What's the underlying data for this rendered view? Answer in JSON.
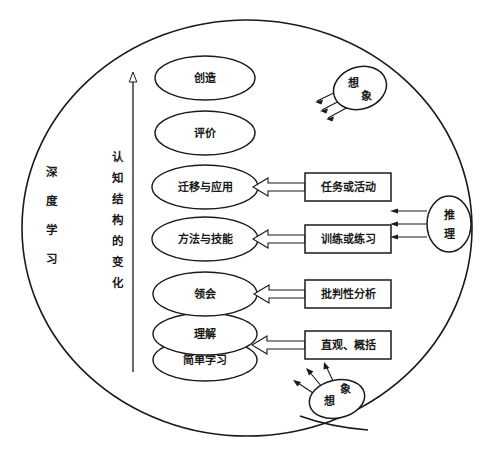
{
  "diagram": {
    "title_text_outer": "深度学习",
    "axis_label": "认知结构的变化",
    "outer_container": {
      "name": "deep-learning-boundary",
      "label_chars": [
        "深",
        "度",
        "学",
        "习"
      ]
    },
    "axis": {
      "name": "cognitive-structure-change-axis",
      "label_chars": [
        "认",
        "知",
        "结",
        "构",
        "的",
        "变",
        "化"
      ],
      "direction": "upward"
    },
    "stages": [
      {
        "id": "create",
        "label": "创造"
      },
      {
        "id": "evaluate",
        "label": "评价"
      },
      {
        "id": "transfer",
        "label": "迁移与应用"
      },
      {
        "id": "methods",
        "label": "方法与技能"
      },
      {
        "id": "comprehend",
        "label": "领会"
      },
      {
        "id": "understand",
        "label": "理解"
      },
      {
        "id": "simple",
        "label": "简单学习"
      }
    ],
    "activity_boxes": [
      {
        "id": "tasks",
        "label": "任务或活动",
        "targets": "transfer"
      },
      {
        "id": "training",
        "label": "训练或练习",
        "targets": "methods"
      },
      {
        "id": "critical",
        "label": "批判性分析",
        "targets": "comprehend"
      },
      {
        "id": "intuition",
        "label": "直观、概括",
        "targets": "understand"
      }
    ],
    "side_nodes": [
      {
        "id": "imagination-top",
        "label_chars": [
          "想",
          "象"
        ],
        "label": "想象",
        "arrows": 3,
        "position": "top-right"
      },
      {
        "id": "reasoning-right",
        "label_chars": [
          "推",
          "理"
        ],
        "label": "推理",
        "arrows": 3,
        "position": "right"
      },
      {
        "id": "imagination-bottom",
        "label_chars": [
          "想",
          "象"
        ],
        "label": "想象",
        "arrows": 3,
        "position": "bottom-right"
      }
    ],
    "colors": {
      "stroke": "#1a1a1a",
      "fill": "#ffffff",
      "background": "#ffffff"
    }
  }
}
